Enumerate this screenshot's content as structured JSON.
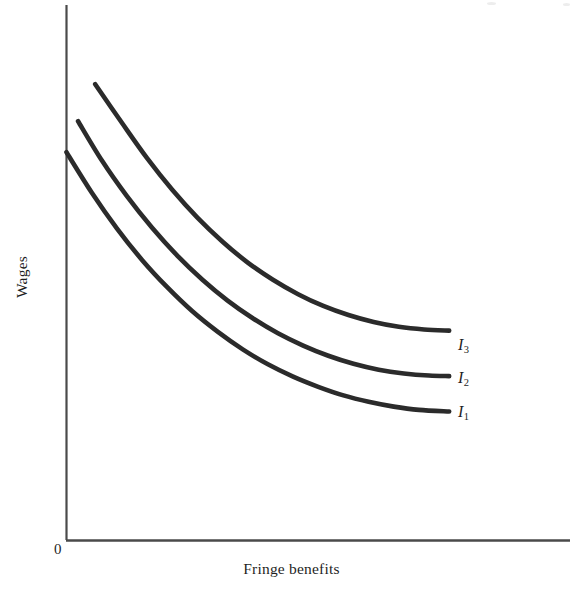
{
  "figure": {
    "background_color": "#ffffff",
    "ink_color": "#2b2b2b",
    "axis_color": "#4a4a4a",
    "origin_label": "0"
  },
  "axes": {
    "x_title": "Fringe benefits",
    "y_title": "Wages"
  },
  "curve_labels": {
    "i1": {
      "base": "I",
      "sub": "1"
    },
    "i2": {
      "base": "I",
      "sub": "2"
    },
    "i3": {
      "base": "I",
      "sub": "3"
    }
  },
  "chart_data": {
    "type": "line",
    "title": "",
    "subtitle": "",
    "xlabel": "Fringe benefits",
    "ylabel": "Wages",
    "xlim": [
      0,
      100
    ],
    "ylim": [
      0,
      100
    ],
    "grid": false,
    "legend_position": "right-of-curve-ends",
    "axis_ticks": {
      "x": [],
      "y": []
    },
    "annotations": [
      {
        "text": "0",
        "x": 0,
        "y": 0,
        "role": "origin-marker"
      },
      {
        "text": "I1",
        "x": 76,
        "y": 24,
        "role": "curve-end-label"
      },
      {
        "text": "I2",
        "x": 76,
        "y": 32,
        "role": "curve-end-label"
      },
      {
        "text": "I3",
        "x": 76,
        "y": 40,
        "role": "curve-end-label"
      }
    ],
    "series": [
      {
        "name": "I1",
        "label": "I₁",
        "description": "lowest indifference curve",
        "color": "#2b2b2b",
        "x": [
          0,
          5,
          10,
          15,
          20,
          25,
          30,
          35,
          40,
          45,
          50,
          55,
          60,
          65,
          70,
          76
        ],
        "y": [
          72.5,
          65.0,
          58.3,
          52.4,
          47.3,
          42.8,
          39.0,
          35.7,
          32.9,
          30.6,
          28.7,
          27.1,
          25.9,
          25.0,
          24.4,
          24.1
        ]
      },
      {
        "name": "I2",
        "label": "I₂",
        "description": "middle indifference curve",
        "color": "#2b2b2b",
        "x": [
          2.3,
          7,
          12,
          17,
          22,
          27,
          32,
          37,
          42,
          47,
          52,
          57,
          62,
          67,
          72,
          76
        ],
        "y": [
          78.3,
          71.0,
          64.3,
          58.4,
          53.2,
          48.7,
          44.8,
          41.5,
          38.7,
          36.4,
          34.5,
          33.0,
          31.9,
          31.2,
          30.8,
          30.7
        ]
      },
      {
        "name": "I3",
        "label": "I₃",
        "description": "highest indifference curve",
        "color": "#2b2b2b",
        "x": [
          5.7,
          11,
          16,
          21,
          26,
          31,
          36,
          41,
          46,
          51,
          56,
          61,
          66,
          71,
          76
        ],
        "y": [
          85.2,
          78.0,
          71.4,
          65.5,
          60.3,
          55.8,
          51.9,
          48.7,
          46.0,
          43.8,
          42.1,
          40.8,
          39.9,
          39.4,
          39.2
        ]
      }
    ]
  }
}
